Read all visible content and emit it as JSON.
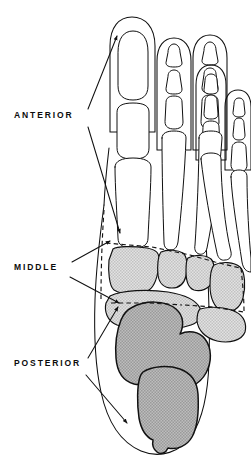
{
  "figure": {
    "view": "dorsal view of right foot",
    "background_color": "#ffffff",
    "line_color": "#111111"
  },
  "labels": [
    {
      "id": "anterior",
      "text": "ANTERIOR",
      "x": 14,
      "y": 118
    },
    {
      "id": "middle",
      "text": "MIDDLE",
      "x": 14,
      "y": 270
    },
    {
      "id": "posterior",
      "text": "POSTERIOR",
      "x": 14,
      "y": 366
    }
  ],
  "regions": [
    {
      "id": "anterior",
      "label": "ANTERIOR",
      "contents": "phalanges and metatarsals",
      "fill": "#ffffff",
      "fill_name": "white"
    },
    {
      "id": "middle",
      "label": "MIDDLE",
      "contents": "cuneiforms, cuboid and navicular",
      "fill": "#d9d9d9",
      "fill_name": "light gray stipple"
    },
    {
      "id": "posterior",
      "label": "POSTERIOR",
      "contents": "talus and calcaneus",
      "fill": "#a8a8a8",
      "fill_name": "medium gray stipple"
    }
  ],
  "boundaries": [
    {
      "id": "anterior-middle-divider",
      "style": "dashed",
      "orientation": "diagonal"
    },
    {
      "id": "middle-posterior-divider",
      "style": "dashed",
      "orientation": "horizontal"
    },
    {
      "id": "lateral-divider",
      "style": "dashed",
      "orientation": "vertical"
    }
  ],
  "toes": [
    {
      "id": "toe-1",
      "name": "great toe",
      "phalanx_count": 2
    },
    {
      "id": "toe-2",
      "name": "second toe",
      "phalanx_count": 3
    },
    {
      "id": "toe-3",
      "name": "third toe",
      "phalanx_count": 3
    },
    {
      "id": "toe-4",
      "name": "fourth toe",
      "phalanx_count": 3
    },
    {
      "id": "toe-5",
      "name": "fifth toe",
      "phalanx_count": 3
    }
  ],
  "metatarsal_count": 5
}
